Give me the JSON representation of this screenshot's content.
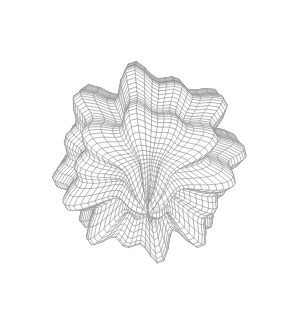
{
  "figure": {
    "type": "3d-wireframe-surface",
    "caption": "",
    "background_color": "#ffffff",
    "line_color": "#8a8a8a",
    "line_width": 0.45,
    "face_color": "#ffffff",
    "shading": "hidden-surface-removal",
    "has_axes": false,
    "has_labels": false,
    "has_legend": false,
    "has_colorbar": false,
    "has_text": false
  },
  "chart_data": {
    "type": "surface",
    "subtitle": "",
    "xlabel": "",
    "ylabel": "",
    "zlabel": "",
    "grid": false,
    "legend": null,
    "annotations": [],
    "surface_kind": "spherical_harmonic",
    "radius_formula": "r(theta,phi) = 1 + a*sin(m1*phi)^m2 + a*cos(m3*theta)^m4 + a*sin(m5*phi)^m6 + a*cos(m7*theta)^m8",
    "harmonic_exponents": {
      "m1": 4,
      "m2": 2,
      "m3": 5,
      "m4": 2,
      "m5": 6,
      "m6": 2,
      "m7": 4,
      "m8": 2
    },
    "amplitude": 0.27,
    "base_radius": 1.0,
    "mesh": {
      "u_divisions": 76,
      "v_divisions": 76,
      "u_range": [
        0,
        3.141592653589793
      ],
      "v_range": [
        0,
        6.283185307179586
      ]
    },
    "camera": {
      "azimuth_deg": 26,
      "elevation_deg": 22,
      "roll_deg": 0,
      "projection": "perspective",
      "distance": 6.2,
      "focal_length": 3.1
    },
    "viewport": {
      "width": 296,
      "height": 311,
      "center_x": 148,
      "center_y": 158,
      "scale": 104
    },
    "bounds_px": {
      "left": 13,
      "right": 285,
      "top": 12,
      "bottom": 302
    },
    "features": [
      {
        "name": "top-center-pit",
        "approx_px": [
          160,
          45
        ],
        "description": "deep concave depression where mesh lines converge"
      },
      {
        "name": "upper-left-lobe",
        "approx_px": [
          100,
          35
        ],
        "description": "rounded raised bump"
      },
      {
        "name": "upper-right-lobe",
        "approx_px": [
          215,
          40
        ],
        "description": "rounded raised bump"
      },
      {
        "name": "left-bulge",
        "approx_px": [
          28,
          165
        ],
        "description": "outward side lobe"
      },
      {
        "name": "right-bulge",
        "approx_px": [
          272,
          170
        ],
        "description": "outward side lobe"
      },
      {
        "name": "bottom-spike",
        "approx_px": [
          138,
          290
        ],
        "description": "downward protruding lobe"
      },
      {
        "name": "bottom-right-lobe",
        "approx_px": [
          225,
          255
        ],
        "description": "lower rounded bump"
      }
    ]
  }
}
